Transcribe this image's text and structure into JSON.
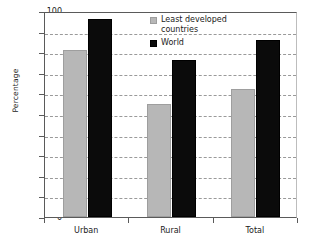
{
  "chart_data": {
    "type": "bar",
    "title": "",
    "xlabel": "",
    "ylabel": "Percentage",
    "ylim": [
      0,
      100
    ],
    "ytick_step": 10,
    "yticks": [
      100,
      90,
      80,
      70,
      60,
      50,
      40,
      30,
      20,
      10,
      0
    ],
    "grid": "horizontal-dashed",
    "legend_position": "inside-top-center",
    "categories": [
      "Urban",
      "Rural",
      "Total"
    ],
    "series": [
      {
        "name": "Least developed countries",
        "color": "#b7b7b7",
        "values": [
          81,
          55,
          62
        ]
      },
      {
        "name": "World",
        "color": "#0b0b0b",
        "values": [
          96,
          76,
          86
        ]
      }
    ]
  },
  "legend": {
    "items": [
      {
        "label": "Least developed\ncountries",
        "swatch": "gray-square-marker"
      },
      {
        "label": "World",
        "swatch": "black-square-marker"
      }
    ]
  }
}
